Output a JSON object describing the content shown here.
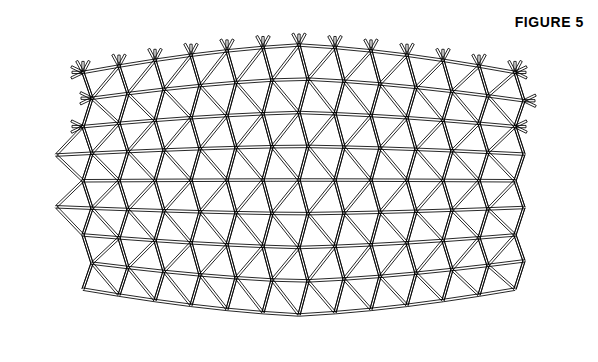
{
  "figure": {
    "title": "FIGURE 5",
    "line_color": "#000000",
    "background_color": "#ffffff",
    "node_fill": "#ffffff"
  },
  "callouts": [
    {
      "id": "c-22-top",
      "label": "22",
      "x": 183,
      "y": 45,
      "leader": "curved-arrow-down-right"
    },
    {
      "id": "c-21-top",
      "label": "21",
      "x": 299,
      "y": 32,
      "leader": "curve-to-dashed-centerline"
    },
    {
      "id": "c-24-topright",
      "label": "24",
      "x": 380,
      "y": 44,
      "leader": "double-curved-brace"
    },
    {
      "id": "c-23-topright",
      "label": "23",
      "x": 459,
      "y": 56,
      "leader": "straight-to-strut-end"
    },
    {
      "id": "c-21-topleft",
      "label": "21",
      "x": 116,
      "y": 74,
      "leader": "curve-down-to-node"
    },
    {
      "id": "c-24-bottomleft",
      "label": "24",
      "x": 66,
      "y": 296,
      "leader": "double-curved-brace"
    },
    {
      "id": "c-21-bottomleft",
      "label": "21",
      "x": 186,
      "y": 320,
      "leader": "curve-up-right-to-strut"
    },
    {
      "id": "c-21-bottomright",
      "label": "21",
      "x": 393,
      "y": 331,
      "leader": "arrow-up-right"
    },
    {
      "id": "c-23-bottomright",
      "label": "23",
      "x": 440,
      "y": 320,
      "leader": "double-curved-brace"
    }
  ],
  "section_markers": [
    {
      "id": "sec-left",
      "label": "6",
      "x": 38,
      "y": 252,
      "arrow": "up",
      "side": "left"
    },
    {
      "id": "sec-right",
      "label": "6",
      "x": 536,
      "y": 245,
      "arrow": "up",
      "side": "right"
    }
  ]
}
